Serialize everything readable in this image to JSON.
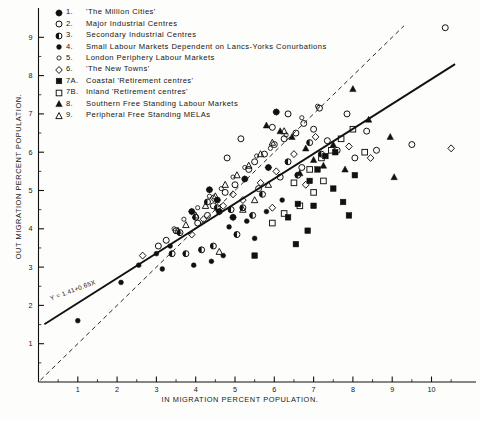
{
  "chart_data": {
    "type": "scatter",
    "title": "",
    "xlabel": "IN MIGRATION PERCENT POPULATION.",
    "ylabel": "OUT MIGRATION PERCENT POPULATION.",
    "xlim": [
      0,
      10.9
    ],
    "ylim": [
      0,
      9.6
    ],
    "xticks": [
      1,
      2,
      3,
      4,
      5,
      6,
      7,
      8,
      9,
      10
    ],
    "yticks": [
      1,
      2,
      3,
      4,
      5,
      6,
      7,
      8,
      9
    ],
    "xtick_labels": [
      "1",
      "2",
      "3",
      "4",
      "5",
      "6",
      "7",
      "8",
      "9",
      "10"
    ],
    "ytick_labels": [
      "1",
      "2",
      "3",
      "4",
      "5",
      "6",
      "7",
      "8",
      "9"
    ],
    "minor_ticks": true,
    "grid": false,
    "legend_position": "top-left",
    "annotations": [
      {
        "text": "Y = 1.41+0.65X",
        "x": 1.0,
        "y": 2.0,
        "rotation": -20.5
      }
    ],
    "lines": [
      {
        "name": "regression-line",
        "style": "solid",
        "equation": "Y = 1.41+0.65X",
        "intercept": 1.41,
        "slope": 0.65,
        "x_from": 0.15,
        "x_to": 10.6
      },
      {
        "name": "reference-line-y-equals-x",
        "style": "dashed",
        "intercept": 0.0,
        "slope": 1.0,
        "x_from": 0.05,
        "x_to": 9.3
      }
    ],
    "series": [
      {
        "name": "'The Million Cities'",
        "key": "1",
        "marker": "circle-star-filled",
        "points": [
          [
            4.35,
            5.02
          ],
          [
            4.55,
            4.75
          ],
          [
            4.6,
            4.45
          ],
          [
            5.25,
            5.3
          ],
          [
            5.85,
            5.6
          ],
          [
            6.05,
            7.05
          ],
          [
            3.9,
            4.45
          ],
          [
            4.95,
            4.3
          ]
        ]
      },
      {
        "name": "Major Industrial Centres",
        "key": "2",
        "marker": "circle-open",
        "points": [
          [
            4.05,
            4.15
          ],
          [
            4.3,
            4.35
          ],
          [
            4.45,
            4.6
          ],
          [
            4.75,
            4.95
          ],
          [
            5.0,
            5.15
          ],
          [
            5.35,
            5.55
          ],
          [
            5.5,
            5.75
          ],
          [
            5.75,
            5.95
          ],
          [
            6.0,
            6.2
          ],
          [
            6.25,
            6.35
          ],
          [
            6.55,
            6.5
          ],
          [
            6.75,
            6.75
          ],
          [
            7.0,
            6.6
          ],
          [
            7.35,
            6.3
          ],
          [
            7.6,
            6.05
          ],
          [
            8.05,
            5.85
          ],
          [
            8.6,
            6.05
          ],
          [
            10.35,
            9.25
          ],
          [
            9.5,
            6.2
          ],
          [
            5.15,
            6.35
          ],
          [
            4.8,
            5.85
          ],
          [
            3.5,
            3.95
          ],
          [
            3.25,
            3.7
          ],
          [
            3.05,
            3.55
          ],
          [
            7.15,
            7.15
          ],
          [
            6.35,
            7.0
          ],
          [
            5.95,
            6.65
          ],
          [
            8.35,
            6.55
          ],
          [
            7.85,
            7.0
          ],
          [
            6.7,
            5.6
          ],
          [
            6.15,
            5.35
          ],
          [
            5.6,
            5.05
          ]
        ]
      },
      {
        "name": "Secondary Industrial Centres",
        "key": "3",
        "marker": "circle-half-filled",
        "points": [
          [
            3.6,
            3.9
          ],
          [
            4.0,
            4.3
          ],
          [
            4.3,
            4.7
          ],
          [
            4.55,
            4.55
          ],
          [
            4.9,
            4.5
          ],
          [
            5.2,
            4.55
          ],
          [
            5.45,
            4.35
          ],
          [
            6.35,
            5.75
          ],
          [
            6.6,
            5.4
          ],
          [
            5.05,
            3.85
          ],
          [
            4.45,
            3.55
          ],
          [
            3.75,
            3.35
          ],
          [
            6.9,
            6.25
          ],
          [
            7.2,
            5.95
          ],
          [
            5.7,
            4.9
          ],
          [
            4.15,
            3.45
          ],
          [
            3.4,
            3.35
          ]
        ]
      },
      {
        "name": "Small Labour Markets Dependent on Lancs-Yorks Conurbations",
        "key": "4",
        "marker": "circle-small-filled",
        "points": [
          [
            1.0,
            1.6
          ],
          [
            2.1,
            2.6
          ],
          [
            2.55,
            3.05
          ],
          [
            3.0,
            3.35
          ],
          [
            3.35,
            3.55
          ],
          [
            4.85,
            4.05
          ],
          [
            5.3,
            4.2
          ],
          [
            5.5,
            3.75
          ],
          [
            4.7,
            3.3
          ],
          [
            3.95,
            3.05
          ],
          [
            5.8,
            4.45
          ],
          [
            6.2,
            4.75
          ],
          [
            4.4,
            3.15
          ],
          [
            3.15,
            2.95
          ]
        ]
      },
      {
        "name": "London Periphery Labour Markets",
        "key": "5",
        "marker": "circle-tiny-open",
        "points": [
          [
            4.05,
            4.55
          ],
          [
            4.35,
            4.85
          ],
          [
            4.65,
            5.05
          ],
          [
            4.95,
            5.35
          ],
          [
            5.25,
            5.6
          ],
          [
            5.55,
            5.9
          ],
          [
            5.9,
            6.1
          ],
          [
            6.3,
            6.45
          ],
          [
            6.7,
            6.9
          ],
          [
            7.1,
            7.2
          ],
          [
            3.7,
            4.25
          ],
          [
            3.45,
            4.0
          ]
        ]
      },
      {
        "name": "'The New Towns'",
        "key": "6",
        "marker": "diamond-open",
        "points": [
          [
            2.65,
            3.3
          ],
          [
            4.45,
            4.8
          ],
          [
            4.7,
            4.6
          ],
          [
            4.95,
            4.9
          ],
          [
            5.2,
            4.75
          ],
          [
            5.65,
            5.2
          ],
          [
            6.05,
            5.5
          ],
          [
            6.5,
            5.95
          ],
          [
            7.05,
            6.4
          ],
          [
            7.9,
            6.15
          ],
          [
            8.45,
            5.85
          ],
          [
            10.5,
            6.1
          ],
          [
            4.2,
            4.25
          ],
          [
            3.9,
            3.85
          ],
          [
            5.95,
            4.55
          ],
          [
            6.8,
            5.15
          ]
        ]
      },
      {
        "name": "Coastal 'Retirement centres'",
        "key": "7A",
        "marker": "square-filled",
        "points": [
          [
            5.5,
            3.3
          ],
          [
            6.35,
            4.3
          ],
          [
            6.6,
            4.65
          ],
          [
            6.9,
            5.25
          ],
          [
            7.1,
            5.55
          ],
          [
            7.3,
            5.9
          ],
          [
            7.0,
            4.6
          ],
          [
            7.5,
            5.05
          ],
          [
            7.75,
            4.7
          ],
          [
            7.9,
            4.35
          ],
          [
            6.85,
            3.95
          ],
          [
            6.55,
            3.6
          ],
          [
            7.55,
            6.0
          ],
          [
            8.05,
            5.4
          ]
        ]
      },
      {
        "name": "Inland 'Retirement centres'",
        "key": "7B",
        "marker": "square-open",
        "points": [
          [
            6.5,
            5.2
          ],
          [
            6.9,
            5.55
          ],
          [
            7.2,
            5.85
          ],
          [
            7.45,
            6.05
          ],
          [
            7.7,
            6.35
          ],
          [
            7.25,
            5.25
          ],
          [
            7.0,
            4.95
          ],
          [
            6.65,
            4.6
          ],
          [
            8.0,
            6.6
          ],
          [
            8.3,
            6.0
          ],
          [
            6.25,
            4.4
          ],
          [
            5.95,
            4.15
          ]
        ]
      },
      {
        "name": "Southern Free Standing Labour Markets",
        "key": "8",
        "marker": "triangle-filled",
        "points": [
          [
            6.15,
            6.55
          ],
          [
            6.45,
            6.4
          ],
          [
            6.8,
            6.1
          ],
          [
            7.0,
            5.8
          ],
          [
            7.25,
            5.65
          ],
          [
            7.5,
            6.2
          ],
          [
            8.0,
            7.65
          ],
          [
            8.4,
            6.85
          ],
          [
            8.95,
            6.4
          ],
          [
            9.05,
            5.35
          ],
          [
            7.8,
            5.55
          ],
          [
            6.65,
            5.45
          ],
          [
            5.8,
            6.7
          ]
        ]
      },
      {
        "name": "Peripheral Free Standing MELAs",
        "key": "9",
        "marker": "triangle-open",
        "points": [
          [
            4.25,
            4.6
          ],
          [
            4.5,
            4.85
          ],
          [
            4.75,
            5.15
          ],
          [
            5.05,
            5.4
          ],
          [
            5.35,
            5.65
          ],
          [
            5.65,
            5.95
          ],
          [
            5.95,
            6.25
          ],
          [
            6.25,
            6.55
          ],
          [
            4.0,
            4.35
          ],
          [
            3.75,
            4.1
          ],
          [
            5.2,
            4.5
          ],
          [
            5.5,
            4.75
          ],
          [
            4.6,
            3.4
          ],
          [
            5.85,
            5.15
          ],
          [
            3.55,
            3.95
          ]
        ]
      }
    ]
  },
  "legend": {
    "items": [
      {
        "num": "1.",
        "label": "'The Million Cities'",
        "marker": "circle-star-filled"
      },
      {
        "num": "2.",
        "label": "Major Industrial Centres",
        "marker": "circle-open"
      },
      {
        "num": "3.",
        "label": "Secondary Industrial Centres",
        "marker": "circle-half-filled"
      },
      {
        "num": "4.",
        "label": "Small Labour Markets Dependent on Lancs-Yorks Conurbations",
        "marker": "circle-small-filled"
      },
      {
        "num": "5.",
        "label": "London Periphery Labour Markets",
        "marker": "circle-tiny-open"
      },
      {
        "num": "6.",
        "label": "'The New Towns'",
        "marker": "diamond-open"
      },
      {
        "num": "7A.",
        "label": "Coastal 'Retirement centres'",
        "marker": "square-filled"
      },
      {
        "num": "7B.",
        "label": "Inland 'Retirement centres'",
        "marker": "square-open"
      },
      {
        "num": "8.",
        "label": "Southern Free Standing Labour Markets",
        "marker": "triangle-filled"
      },
      {
        "num": "9.",
        "label": "Peripheral Free Standing MELAs",
        "marker": "triangle-open"
      }
    ]
  },
  "colors": {
    "ink": "#111111",
    "background": "#fdfdfb",
    "axis": "#2b2b2b"
  }
}
